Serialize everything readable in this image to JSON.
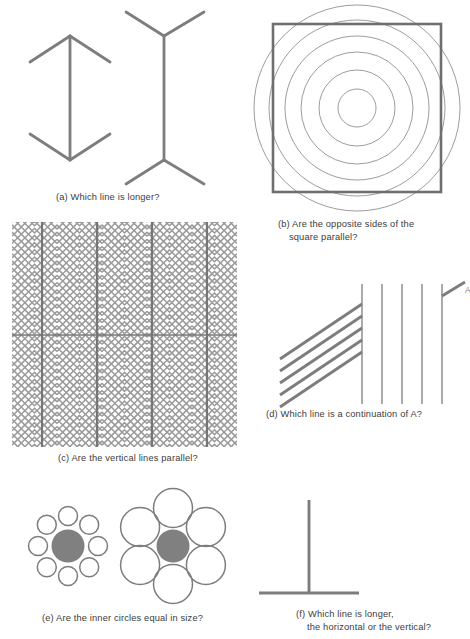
{
  "document": {
    "type": "figure-plate",
    "title": "Classic geometrical optical illusions",
    "background_color": "#ffffff",
    "ink_color": "#7d7d7d",
    "caption_color": "#3c3c3c",
    "fill_color": "#808080",
    "width": 470,
    "height": 639
  },
  "panels": [
    {
      "id": "a",
      "illusion_name": "muller-lyer",
      "caption_line1": "(a) Which line is longer?",
      "caption_line2": "",
      "figures": [
        {
          "name": "arrow-inward-figure",
          "shaft": "vertical",
          "fin_direction": "inward"
        },
        {
          "name": "arrow-outward-figure",
          "shaft": "vertical",
          "fin_direction": "outward"
        }
      ]
    },
    {
      "id": "b",
      "illusion_name": "ehrenstein-orbison",
      "caption_line1": "(b) Are the opposite sides of the",
      "caption_line2": "square parallel?",
      "concentric_circle_count": 6,
      "circle_radii": [
        19,
        38,
        56,
        72,
        88,
        103
      ],
      "square_side": 168,
      "square_stroke_width": 2.6
    },
    {
      "id": "c",
      "illusion_name": "zollner-herringbone",
      "caption_line1": "(c) Are the vertical lines parallel?",
      "caption_line2": "",
      "vertical_line_count": 4,
      "horizontal_line_count": 1,
      "chevron_columns": 5,
      "chevron_spacing": 7.2
    },
    {
      "id": "d",
      "illusion_name": "poggendorff",
      "caption_line1": "(d) Which line is a continuation of A?",
      "caption_line2": "",
      "oblique_line_count": 5,
      "vertical_line_count": 5,
      "pointer_label": "A"
    },
    {
      "id": "e",
      "illusion_name": "ebbinghaus-titchener",
      "caption_line1": "(e) Are the inner circles equal in size?",
      "caption_line2": "",
      "left_group": {
        "name": "small-surround-group",
        "surround_count": 8,
        "surround_radius": 9.5,
        "surround_ring_radius": 30,
        "center_radius": 16.5
      },
      "right_group": {
        "name": "large-surround-group",
        "surround_count": 6,
        "surround_radius": 19.5,
        "surround_ring_radius": 38,
        "center_radius": 16.5
      }
    },
    {
      "id": "f",
      "illusion_name": "vertical-horizontal",
      "caption_line1": "(f) Which line is longer,",
      "caption_line2": "the horizontal or the vertical?",
      "vertical_length": 93,
      "horizontal_length": 100
    }
  ]
}
